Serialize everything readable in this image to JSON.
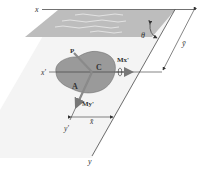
{
  "diagram": {
    "type": "hydrostatic force on inclined submerged plane area",
    "labels": {
      "x_top": "x",
      "y_bottom": "y",
      "x_prime": "x'",
      "y_prime": "y'",
      "theta": "θ",
      "y_bar": "ȳ",
      "x_bar": "x̄",
      "centroid": "C",
      "area": "A",
      "force": "P",
      "moment_x": "Mx'",
      "moment_y": "My'"
    },
    "colors": {
      "water_surface": "#b9b9b9",
      "plane": "#f2f2f2",
      "area_fill": "#9a9a9a",
      "line": "#333333",
      "arrow": "#7a7a7a"
    }
  }
}
